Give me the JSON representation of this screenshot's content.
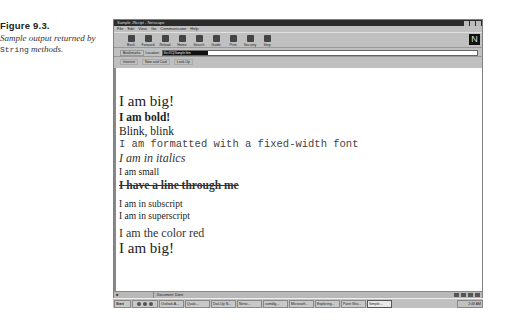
{
  "caption": {
    "figure": "Figure 9.3.",
    "description_prefix": "Sample output returned by ",
    "description_code": "String",
    "description_suffix": " methods."
  },
  "window": {
    "title": "Sample JScript - Netscape",
    "menu": [
      "File",
      "Edit",
      "View",
      "Go",
      "Communicator",
      "Help"
    ],
    "toolbar": [
      "Back",
      "Forward",
      "Reload",
      "Home",
      "Search",
      "Guide",
      "Print",
      "Security",
      "Stop"
    ],
    "location": {
      "bookmarks_label": "Bookmarks",
      "location_label": "Location:",
      "value": "file:///C|/Sample.htm"
    },
    "personal_toolbar": [
      "Internet",
      "New and Cool",
      "Look Up"
    ],
    "logo": "N",
    "status": "Document: Done"
  },
  "content": {
    "lines": [
      "I am big!",
      "I am bold!",
      "Blink, blink",
      "I am formatted with a fixed-width font",
      "I am in italics",
      "I am small",
      "I have a line through me",
      "I am in subscript",
      "I am in superscript",
      "I am the color red",
      "I am big!"
    ]
  },
  "taskbar": {
    "start": "Start",
    "tasks": [
      "Outlook A...",
      "Qualc...",
      "Dial-Up N...",
      "Netsc...",
      "comdlg...",
      "Microsoft...",
      "Exploring...",
      "Paint Sho...",
      "Simple..."
    ],
    "active_task": "Simple...",
    "clock": "2:48 AM"
  }
}
